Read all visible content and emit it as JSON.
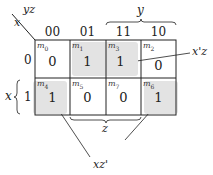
{
  "kmap": {
    "corner": {
      "row_var": "x",
      "col_var": "yz"
    },
    "col_headers": [
      "00",
      "01",
      "11",
      "10"
    ],
    "row_headers": [
      "0",
      "1"
    ],
    "cells": [
      [
        {
          "minterm": "m",
          "index": "0",
          "value": "0",
          "shaded": false
        },
        {
          "minterm": "m",
          "index": "1",
          "value": "1",
          "shaded": true
        },
        {
          "minterm": "m",
          "index": "3",
          "value": "1",
          "shaded": true
        },
        {
          "minterm": "m",
          "index": "2",
          "value": "0",
          "shaded": false
        }
      ],
      [
        {
          "minterm": "m",
          "index": "4",
          "value": "1",
          "shaded": true
        },
        {
          "minterm": "m",
          "index": "5",
          "value": "0",
          "shaded": false
        },
        {
          "minterm": "m",
          "index": "7",
          "value": "0",
          "shaded": false
        },
        {
          "minterm": "m",
          "index": "6",
          "value": "1",
          "shaded": true
        }
      ]
    ],
    "brace_labels": {
      "y": "y",
      "x": "x",
      "z": "z"
    },
    "groups": [
      {
        "label": "x'z",
        "cells": [
          "m1",
          "m3"
        ]
      },
      {
        "label": "xz'",
        "cells": [
          "m4",
          "m6"
        ]
      }
    ],
    "colors": {
      "shade": "#e3e3e3",
      "line": "#222222"
    }
  }
}
